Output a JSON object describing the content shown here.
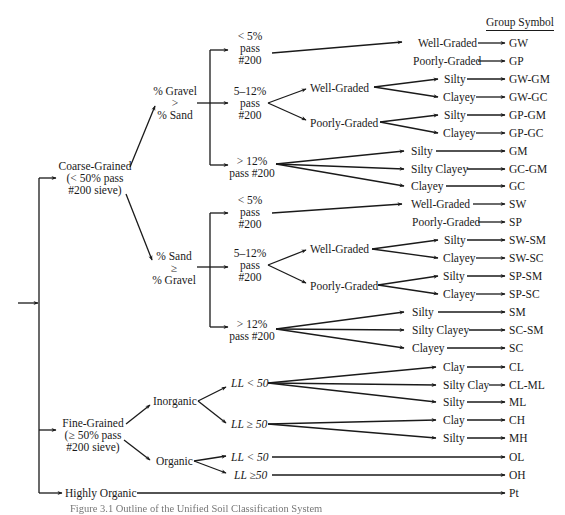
{
  "figure": {
    "column_header": "Group Symbol",
    "caption": "Figure 3.1  Outline of the Unified Soil Classification System"
  },
  "root": {
    "coarse": {
      "line1": "Coarse-Grained",
      "line2": "(< 50% pass",
      "line3": "#200 sieve)"
    },
    "fine": {
      "line1": "Fine-Grained",
      "line2": "(≥ 50% pass",
      "line3": "#200 sieve)"
    },
    "highly_organic": "Highly Organic"
  },
  "gravel": {
    "branch": {
      "line1": "% Gravel",
      "line2": ">",
      "line3": "% Sand"
    },
    "lt5": {
      "line1": "< 5%",
      "line2": "pass",
      "line3": "#200"
    },
    "mid": {
      "line1": "5–12%",
      "line2": "pass",
      "line3": "#200"
    },
    "gt12": {
      "line1": "> 12%",
      "line2": "pass #200"
    },
    "mid_well": "Well-Graded",
    "mid_poor": "Poorly-Graded",
    "leaves": [
      {
        "label": "Well-Graded",
        "symbol": "GW"
      },
      {
        "label": "Poorly-Graded",
        "symbol": "GP"
      },
      {
        "label": "Silty",
        "symbol": "GW-GM"
      },
      {
        "label": "Clayey",
        "symbol": "GW-GC"
      },
      {
        "label": "Silty",
        "symbol": "GP-GM"
      },
      {
        "label": "Clayey",
        "symbol": "GP-GC"
      },
      {
        "label": "Silty",
        "symbol": "GM"
      },
      {
        "label": "Silty Clayey",
        "symbol": "GC-GM"
      },
      {
        "label": "Clayey",
        "symbol": "GC"
      }
    ]
  },
  "sand": {
    "branch": {
      "line1": "% Sand",
      "line2": "≥",
      "line3": "% Gravel"
    },
    "lt5": {
      "line1": "< 5%",
      "line2": "pass",
      "line3": "#200"
    },
    "mid": {
      "line1": "5–12%",
      "line2": "pass",
      "line3": "#200"
    },
    "gt12": {
      "line1": "> 12%",
      "line2": "pass #200"
    },
    "mid_well": "Well-Graded",
    "mid_poor": "Poorly-Graded",
    "leaves": [
      {
        "label": "Well-Graded",
        "symbol": "SW"
      },
      {
        "label": "Poorly-Graded",
        "symbol": "SP"
      },
      {
        "label": "Silty",
        "symbol": "SW-SM"
      },
      {
        "label": "Clayey",
        "symbol": "SW-SC"
      },
      {
        "label": "Silty",
        "symbol": "SP-SM"
      },
      {
        "label": "Clayey",
        "symbol": "SP-SC"
      },
      {
        "label": "Silty",
        "symbol": "SM"
      },
      {
        "label": "Silty Clayey",
        "symbol": "SC-SM"
      },
      {
        "label": "Clayey",
        "symbol": "SC"
      }
    ]
  },
  "fine": {
    "inorganic": "Inorganic",
    "organic": "Organic",
    "inorg_low": "LL < 50",
    "inorg_high": "LL ≥ 50",
    "org_low": "LL < 50",
    "org_high": "LL ≥50",
    "leaves": [
      {
        "label": "Clay",
        "symbol": "CL"
      },
      {
        "label": "Silty Clay",
        "symbol": "CL-ML"
      },
      {
        "label": "Silty",
        "symbol": "ML"
      },
      {
        "label": "Clay",
        "symbol": "CH"
      },
      {
        "label": "Silty",
        "symbol": "MH"
      },
      {
        "label": "",
        "symbol": "OL"
      },
      {
        "label": "",
        "symbol": "OH"
      },
      {
        "label": "",
        "symbol": "Pt"
      }
    ]
  }
}
